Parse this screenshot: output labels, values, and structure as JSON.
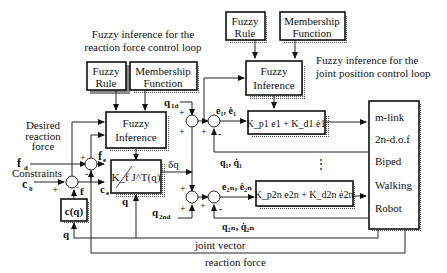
{
  "diagram": {
    "type": "block-diagram",
    "title_force_loop": [
      "Fuzzy inference for the",
      "reaction force control loop"
    ],
    "title_position_loop": [
      "Fuzzy inference for the",
      "joint position control loop"
    ],
    "blocks": {
      "fuzzy_rule_left": [
        "Fuzzy",
        "Rule"
      ],
      "membership_left": [
        "Membership",
        "Function"
      ],
      "fuzzy_inference_left": [
        "Fuzzy",
        "Inference"
      ],
      "fuzzy_rule_right": [
        "Fuzzy",
        "Rule"
      ],
      "membership_right": [
        "Membership",
        "Function"
      ],
      "fuzzy_inference_right": [
        "Fuzzy",
        "Inference"
      ],
      "force_gain": "K_f J^T(q)",
      "constraint_fn": "c(q)",
      "pd_joint1": "K_p1 e1 + K_d1 ė1",
      "pd_joint2n": "K_p2n e2n + K_d2n ė2n",
      "robot": [
        "m-link",
        "2n-d.o.f",
        "Biped",
        "Walking",
        "Robot"
      ]
    },
    "signals": {
      "desired_reaction_force": [
        "Desired",
        "reaction",
        "force"
      ],
      "constraints": "Constraints",
      "f_d": "f",
      "f_d_sub": "d",
      "c0": "c",
      "c0_sub": "0",
      "f_e": "f",
      "f_e_sub": "e",
      "c_e": "c",
      "c_e_sub": "e",
      "f": "f",
      "q": "q",
      "delta_q": "δq",
      "q1d": "q",
      "q1d_sub": "1d",
      "q2nd": "q",
      "q2nd_sub": "2nd",
      "e1": "e₁, ė₁",
      "q1": "q₁, q̇₁",
      "e2n": "e₂ₙ, ė₂ₙ",
      "q2n": "q₂ₙ, q̇₂ₙ",
      "joint_vector": "joint vector",
      "reaction_force": "reaction force",
      "ellipsis": "⋮"
    },
    "signs": {
      "plus": "+",
      "minus": "-"
    }
  }
}
